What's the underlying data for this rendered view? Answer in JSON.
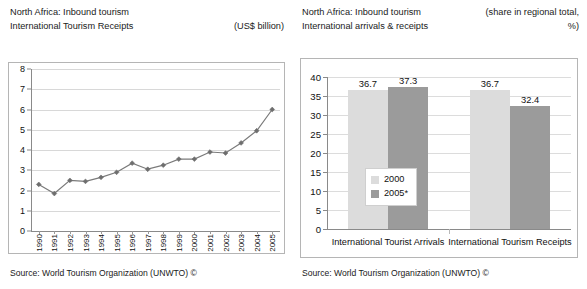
{
  "left_panel": {
    "title_line1": "North Africa: Inbound tourism",
    "title_line2": "International Tourism Receipts",
    "units_note": "(US$ billion)",
    "source": "Source: World Tourism Organization (UNWTO) ©"
  },
  "right_panel": {
    "title_line1": "North Africa: Inbound tourism",
    "title_line2": "International arrivals & receipts",
    "units_note_line1": "(share in regional total,",
    "units_note_line2": "%)",
    "source": "Source: World Tourism Organization (UNWTO) ©"
  },
  "chart_data": [
    {
      "type": "line",
      "title": "North Africa: Inbound tourism - International Tourism Receipts",
      "xlabel": "",
      "ylabel": "",
      "ylim": [
        0,
        8
      ],
      "ytick_step": 1,
      "yticks": [
        "0",
        "1",
        "2",
        "3",
        "4",
        "5",
        "6",
        "7",
        "8"
      ],
      "grid": true,
      "legend": "none",
      "units": "US$ billion",
      "marker": "diamond",
      "line_color": "#7a7a7a",
      "categories": [
        "1990",
        "1991",
        "1992",
        "1993",
        "1994",
        "1995",
        "1996",
        "1997",
        "1998",
        "1999",
        "2000",
        "2001",
        "2002",
        "2003",
        "2004",
        "2005"
      ],
      "values": [
        2.3,
        1.85,
        2.5,
        2.45,
        2.65,
        2.9,
        3.35,
        3.05,
        3.25,
        3.55,
        3.55,
        3.9,
        3.85,
        4.35,
        4.95,
        6.0
      ],
      "source": "Source: World Tourism Organization (UNWTO) ©"
    },
    {
      "type": "bar",
      "title": "North Africa: Inbound tourism - International arrivals & receipts",
      "xlabel": "",
      "ylabel": "",
      "ylim": [
        0,
        40
      ],
      "ytick_step": 5,
      "yticks": [
        "0",
        "5",
        "10",
        "15",
        "20",
        "25",
        "30",
        "35",
        "40"
      ],
      "grid": true,
      "legend": "inside-center-left",
      "units": "share in regional total, %",
      "categories": [
        "International Tourist Arrivals",
        "International Tourism Receipts"
      ],
      "series": [
        {
          "name": "2000",
          "color": "#dcdcdc",
          "values": [
            36.7,
            36.7
          ]
        },
        {
          "name": "2005*",
          "color": "#9b9b9b",
          "values": [
            37.3,
            32.4
          ]
        }
      ],
      "data_labels": [
        [
          "36.7",
          "37.3"
        ],
        [
          "36.7",
          "32.4"
        ]
      ],
      "source": "Source: World Tourism Organization (UNWTO) ©"
    }
  ]
}
